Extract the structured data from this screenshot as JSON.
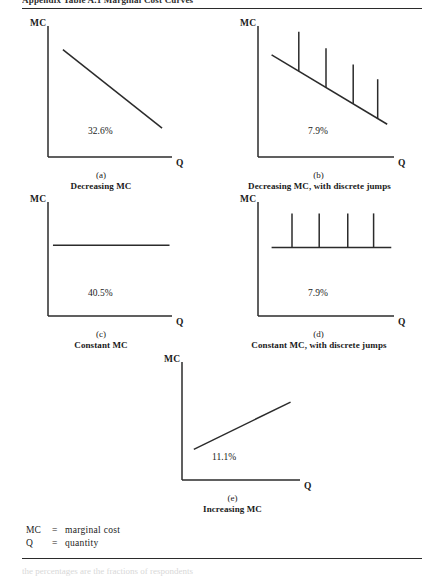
{
  "page": {
    "header": "Appendix  Table  A.1   Marginal  Cost  Curves",
    "footer_faint": "the percentages are the fractions of respondents"
  },
  "legend": {
    "rows": [
      {
        "symbol": "MC",
        "equals": "=",
        "text": "marginal cost"
      },
      {
        "symbol": "Q",
        "equals": "=",
        "text": "quantity"
      }
    ]
  },
  "chart_data": [
    {
      "id": "a",
      "type": "line",
      "title": "Decreasing MC",
      "panel_letter": "(a)",
      "xlabel": "Q",
      "ylabel": "MC",
      "annotation": "32.6%",
      "x": [
        0.12,
        0.92
      ],
      "y": [
        0.82,
        0.22
      ],
      "jumps": [],
      "grid": false
    },
    {
      "id": "b",
      "type": "line",
      "title": "Decreasing MC, with discrete jumps",
      "panel_letter": "(b)",
      "xlabel": "Q",
      "ylabel": "MC",
      "annotation": "7.9%",
      "x": [
        0.1,
        0.95
      ],
      "y": [
        0.78,
        0.25
      ],
      "jumps": [
        0.3,
        0.5,
        0.7,
        0.88
      ],
      "jump_height": 0.3,
      "grid": false
    },
    {
      "id": "c",
      "type": "line",
      "title": "Constant MC",
      "panel_letter": "(c)",
      "xlabel": "Q",
      "ylabel": "MC",
      "annotation": "40.5%",
      "x": [
        0.04,
        0.98
      ],
      "y": [
        0.62,
        0.62
      ],
      "jumps": [],
      "grid": false
    },
    {
      "id": "d",
      "type": "line",
      "title": "Constant MC, with discrete jumps",
      "panel_letter": "(d)",
      "xlabel": "Q",
      "ylabel": "MC",
      "annotation": "7.9%",
      "x": [
        0.1,
        0.98
      ],
      "y": [
        0.6,
        0.6
      ],
      "jumps": [
        0.25,
        0.45,
        0.66,
        0.85
      ],
      "jump_height": 0.3,
      "grid": false
    },
    {
      "id": "e",
      "type": "line",
      "title": "Increasing MC",
      "panel_letter": "(e)",
      "xlabel": "Q",
      "ylabel": "MC",
      "annotation": "11.1%",
      "x": [
        0.1,
        0.92
      ],
      "y": [
        0.26,
        0.66
      ],
      "jumps": [],
      "grid": false
    }
  ]
}
